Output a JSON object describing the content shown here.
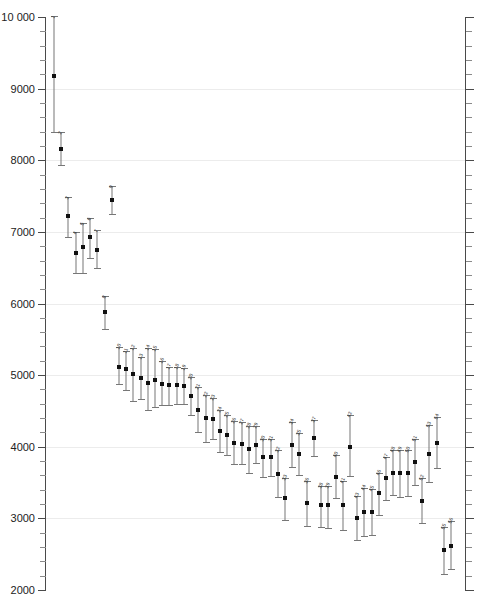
{
  "chart_data": {
    "type": "scatter",
    "title": "",
    "subtitle": "",
    "xlabel": "",
    "ylabel": "",
    "ylim": [
      2000,
      10000
    ],
    "ytick_labels": [
      "10 000",
      "9000",
      "8000",
      "7000",
      "6000",
      "5000",
      "4000",
      "3000",
      "2000"
    ],
    "ytick_values": [
      10000,
      9000,
      8000,
      7000,
      6000,
      5000,
      4000,
      3000,
      2000
    ],
    "yminor_step": 200,
    "grid": true,
    "grid_axis": "y",
    "legend": "none",
    "x_axis_visible": false,
    "right_axis_ticks_only": true,
    "marker_color": "#111111",
    "errorbar_color": "#777777",
    "grid_color": "#ececec",
    "axis_color": "#4a4a4a",
    "point_label_position": "above-left-rotated",
    "series_name": "",
    "points": [
      {
        "label": "1",
        "x": 1,
        "y": 9180,
        "low": 8400,
        "high": 10010
      },
      {
        "label": "2",
        "x": 2,
        "y": 8160,
        "low": 7930,
        "high": 8390
      },
      {
        "label": "3",
        "x": 3,
        "y": 7215,
        "low": 6930,
        "high": 7490
      },
      {
        "label": "4",
        "x": 4,
        "y": 6700,
        "low": 6420,
        "high": 7000
      },
      {
        "label": "5",
        "x": 5,
        "y": 6790,
        "low": 6430,
        "high": 7130
      },
      {
        "label": "6",
        "x": 6,
        "y": 6930,
        "low": 6640,
        "high": 7190
      },
      {
        "label": "7",
        "x": 7,
        "y": 6750,
        "low": 6490,
        "high": 7030
      },
      {
        "label": "8",
        "x": 8,
        "y": 5880,
        "low": 5640,
        "high": 6100
      },
      {
        "label": "9",
        "x": 9,
        "y": 7450,
        "low": 7250,
        "high": 7640
      },
      {
        "label": "10",
        "x": 10,
        "y": 5120,
        "low": 4880,
        "high": 5390
      },
      {
        "label": "11",
        "x": 11,
        "y": 5080,
        "low": 4790,
        "high": 5330
      },
      {
        "label": "12",
        "x": 12,
        "y": 5010,
        "low": 4640,
        "high": 5380
      },
      {
        "label": "13",
        "x": 13,
        "y": 4960,
        "low": 4670,
        "high": 5250
      },
      {
        "label": "14",
        "x": 14,
        "y": 4890,
        "low": 4510,
        "high": 5380
      },
      {
        "label": "15",
        "x": 15,
        "y": 4930,
        "low": 4560,
        "high": 5370
      },
      {
        "label": "16",
        "x": 16,
        "y": 4880,
        "low": 4580,
        "high": 5200
      },
      {
        "label": "17",
        "x": 17,
        "y": 4860,
        "low": 4580,
        "high": 5120
      },
      {
        "label": "18",
        "x": 18,
        "y": 4860,
        "low": 4600,
        "high": 5120
      },
      {
        "label": "19",
        "x": 19,
        "y": 4850,
        "low": 4600,
        "high": 5100
      },
      {
        "label": "20",
        "x": 20,
        "y": 4710,
        "low": 4450,
        "high": 4980
      },
      {
        "label": "21",
        "x": 21,
        "y": 4510,
        "low": 4200,
        "high": 4830
      },
      {
        "label": "22",
        "x": 22,
        "y": 4400,
        "low": 4070,
        "high": 4720
      },
      {
        "label": "23",
        "x": 23,
        "y": 4390,
        "low": 4110,
        "high": 4680
      },
      {
        "label": "24",
        "x": 24,
        "y": 4220,
        "low": 3930,
        "high": 4520
      },
      {
        "label": "25",
        "x": 25,
        "y": 4170,
        "low": 3880,
        "high": 4440
      },
      {
        "label": "26",
        "x": 26,
        "y": 4050,
        "low": 3760,
        "high": 4360
      },
      {
        "label": "27",
        "x": 27,
        "y": 4040,
        "low": 3760,
        "high": 4340
      },
      {
        "label": "28",
        "x": 28,
        "y": 3970,
        "low": 3640,
        "high": 4290
      },
      {
        "label": "29",
        "x": 29,
        "y": 4030,
        "low": 3770,
        "high": 4290
      },
      {
        "label": "30",
        "x": 30,
        "y": 3850,
        "low": 3580,
        "high": 4110
      },
      {
        "label": "31",
        "x": 31,
        "y": 3850,
        "low": 3590,
        "high": 4110
      },
      {
        "label": "32",
        "x": 32,
        "y": 3620,
        "low": 3300,
        "high": 3960
      },
      {
        "label": "33",
        "x": 33,
        "y": 3280,
        "low": 2980,
        "high": 3570
      },
      {
        "label": "34",
        "x": 34,
        "y": 4030,
        "low": 3720,
        "high": 4350
      },
      {
        "label": "35",
        "x": 35,
        "y": 3900,
        "low": 3600,
        "high": 4190
      },
      {
        "label": "36",
        "x": 36,
        "y": 3210,
        "low": 2890,
        "high": 3520
      },
      {
        "label": "37",
        "x": 37,
        "y": 4120,
        "low": 3870,
        "high": 4380
      },
      {
        "label": "38",
        "x": 38,
        "y": 3190,
        "low": 2880,
        "high": 3450
      },
      {
        "label": "39",
        "x": 39,
        "y": 3180,
        "low": 2870,
        "high": 3450
      },
      {
        "label": "40",
        "x": 40,
        "y": 3580,
        "low": 3290,
        "high": 3890
      },
      {
        "label": "41",
        "x": 41,
        "y": 3190,
        "low": 2840,
        "high": 3520
      },
      {
        "label": "42",
        "x": 42,
        "y": 4000,
        "low": 3590,
        "high": 4440
      },
      {
        "label": "43",
        "x": 43,
        "y": 3000,
        "low": 2700,
        "high": 3310
      },
      {
        "label": "44",
        "x": 44,
        "y": 3090,
        "low": 2760,
        "high": 3420
      },
      {
        "label": "45",
        "x": 45,
        "y": 3090,
        "low": 2770,
        "high": 3410
      },
      {
        "label": "46",
        "x": 46,
        "y": 3350,
        "low": 3050,
        "high": 3640
      },
      {
        "label": "47",
        "x": 47,
        "y": 3560,
        "low": 3250,
        "high": 3860
      },
      {
        "label": "48",
        "x": 48,
        "y": 3640,
        "low": 3320,
        "high": 3950
      },
      {
        "label": "49",
        "x": 49,
        "y": 3630,
        "low": 3300,
        "high": 3960
      },
      {
        "label": "50",
        "x": 50,
        "y": 3630,
        "low": 3310,
        "high": 3960
      },
      {
        "label": "51",
        "x": 51,
        "y": 3790,
        "low": 3470,
        "high": 4110
      },
      {
        "label": "52",
        "x": 52,
        "y": 3240,
        "low": 2930,
        "high": 3560
      },
      {
        "label": "53",
        "x": 53,
        "y": 3900,
        "low": 3510,
        "high": 4310
      },
      {
        "label": "54",
        "x": 54,
        "y": 4050,
        "low": 3700,
        "high": 4420
      },
      {
        "label": "55",
        "x": 55,
        "y": 2560,
        "low": 2230,
        "high": 2880
      },
      {
        "label": "56",
        "x": 56,
        "y": 2620,
        "low": 2290,
        "high": 2960
      }
    ]
  }
}
